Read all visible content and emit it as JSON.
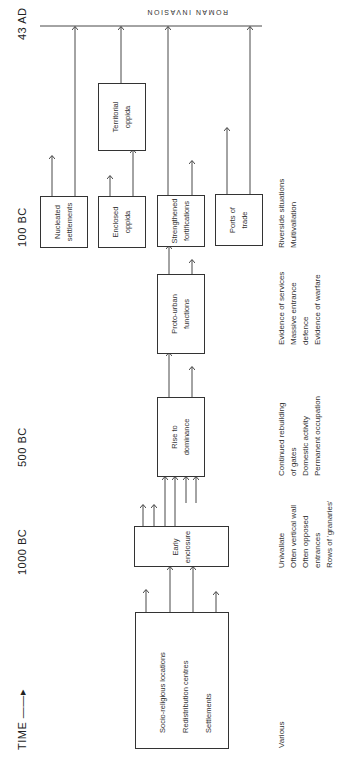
{
  "timeline": {
    "axis_label": "TIME",
    "arrow": "——▸",
    "marks": [
      "43 AD",
      "100 BC",
      "500 BC",
      "1000 BC"
    ]
  },
  "roman_invasion": "ROMAN   INVASION",
  "boxes": {
    "origins": {
      "lines": [
        "Socio-religious  locations",
        "Redistribution  centres",
        "Settlements"
      ]
    },
    "early_enclosure": {
      "lines": [
        "Early",
        "enclosure"
      ]
    },
    "rise_to_dominance": {
      "lines": [
        "Rise  to",
        "dominance"
      ]
    },
    "proto_urban": {
      "lines": [
        "Proto-urban",
        "functions"
      ]
    },
    "nucleated": {
      "lines": [
        "Nucleated",
        "settlements"
      ]
    },
    "enclosed_oppida": {
      "lines": [
        "Enclosed",
        "oppida"
      ]
    },
    "strengthened": {
      "lines": [
        "Strengthened",
        "fortifications"
      ]
    },
    "ports": {
      "lines": [
        "Ports  of",
        "trade"
      ]
    },
    "territorial": {
      "lines": [
        "Territorial",
        "oppida"
      ]
    }
  },
  "characteristics": {
    "various": [
      "Various"
    ],
    "early": [
      "Univallate",
      "Often  vertical  wall",
      "Often  opposed",
      "entrances",
      "Rows  of  'granaries'"
    ],
    "rise": [
      "Continued  rebuilding",
      "of  gates",
      "Domestic  activity",
      "Permanent  occupation"
    ],
    "proto": [
      "Evidence  of  services",
      "Massive  entrance",
      "defence",
      "Evidence  of  warfare"
    ],
    "late": [
      "Riverside  situations",
      "Multivallation"
    ]
  }
}
